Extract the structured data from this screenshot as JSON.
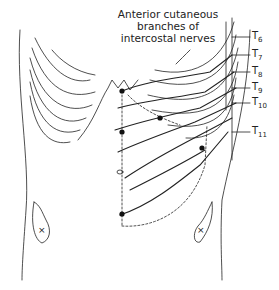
{
  "figure": {
    "title_lines": [
      "Anterior cutaneous",
      "branches of",
      "intercostal nerves"
    ],
    "nerve_labels": [
      {
        "base": "T",
        "sub": "6",
        "x": 252,
        "y": 37
      },
      {
        "base": "T",
        "sub": "7",
        "x": 252,
        "y": 55
      },
      {
        "base": "T",
        "sub": "8",
        "x": 252,
        "y": 72
      },
      {
        "base": "T",
        "sub": "9",
        "x": 252,
        "y": 88
      },
      {
        "base": "T",
        "sub": "10",
        "x": 252,
        "y": 103
      },
      {
        "base": "T",
        "sub": "11",
        "x": 252,
        "y": 132
      }
    ],
    "markers": {
      "left_asis": "×",
      "right_asis": "×"
    },
    "colors": {
      "line": "#222222",
      "background": "#ffffff"
    }
  }
}
